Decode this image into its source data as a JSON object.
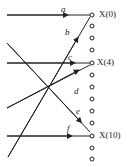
{
  "diagram": {
    "edges": [
      {
        "id": "a",
        "label": "a",
        "target": "X(0)"
      },
      {
        "id": "b",
        "label": "b",
        "target": "X(0)"
      },
      {
        "id": "c",
        "label": "c",
        "target": "X(4)"
      },
      {
        "id": "d",
        "label": "d",
        "target": "X(4)"
      },
      {
        "id": "e",
        "label": "e",
        "target": "X(10)"
      },
      {
        "id": "f",
        "label": "f",
        "target": "X(10)"
      }
    ],
    "nodes": [
      {
        "label": "X(0)"
      },
      {
        "label": "X(4)"
      },
      {
        "label": "X(10)"
      }
    ],
    "colors": {
      "line": "#222222",
      "background": "#ffffff"
    }
  }
}
